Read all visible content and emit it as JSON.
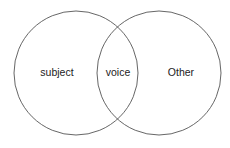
{
  "diagram": {
    "type": "venn",
    "sets": [
      {
        "id": "left",
        "label": "subject",
        "cx": 76,
        "cy": 73,
        "r": 62
      },
      {
        "id": "right",
        "label": "Other",
        "cx": 159,
        "cy": 73,
        "r": 62
      }
    ],
    "intersection": {
      "label": "voice"
    },
    "stroke_color": "#555555",
    "background": "#ffffff"
  }
}
